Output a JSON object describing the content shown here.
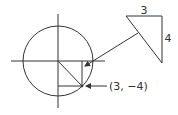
{
  "diagram": {
    "type": "unit-circle-reference-triangle",
    "point_label": "(3, −4)",
    "triangle": {
      "horizontal_leg_label": "3",
      "vertical_leg_label": "4"
    },
    "colors": {
      "stroke": "#333333",
      "background": "#ffffff"
    }
  }
}
